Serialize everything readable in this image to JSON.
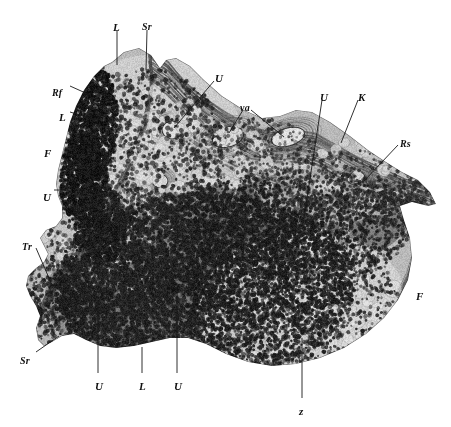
{
  "figure": {
    "type": "histological-micrograph-illustration",
    "background_color": "#ffffff",
    "ink_color": "#1a1a1a",
    "width_px": 451,
    "height_px": 427
  },
  "labels": [
    {
      "id": "L-top",
      "text": "L",
      "x": 113,
      "y": 22,
      "note": "top edge, left leader"
    },
    {
      "id": "Sr-top",
      "text": "Sr",
      "x": 142,
      "y": 22,
      "note": "top edge, right leader"
    },
    {
      "id": "Rf-left",
      "text": "Rf",
      "x": 52,
      "y": 88,
      "note": "upper-left, two-branch leader"
    },
    {
      "id": "L-left",
      "text": "L",
      "x": 59,
      "y": 112,
      "note": "upper-left below Rf"
    },
    {
      "id": "F-left",
      "text": "F",
      "x": 44,
      "y": 148,
      "note": "free standing, left field"
    },
    {
      "id": "U-leftmid",
      "text": "U",
      "x": 43,
      "y": 192,
      "note": "left mid, short leader"
    },
    {
      "id": "U-upper",
      "text": "U",
      "x": 215,
      "y": 73,
      "note": "upper middle, long leader to vessel"
    },
    {
      "id": "va",
      "text": "va",
      "x": 240,
      "y": 103,
      "note": "two-branch leader to vessel lumens"
    },
    {
      "id": "U-right",
      "text": "U",
      "x": 320,
      "y": 92,
      "note": "upper right, long leader"
    },
    {
      "id": "K-right",
      "text": "K",
      "x": 358,
      "y": 92,
      "note": "upper right capsule"
    },
    {
      "id": "Rs-right",
      "text": "Rs",
      "x": 400,
      "y": 139,
      "note": "right side"
    },
    {
      "id": "F-right",
      "text": "F",
      "x": 416,
      "y": 291,
      "note": "free standing, right field"
    },
    {
      "id": "Tr-left",
      "text": "Tr",
      "x": 22,
      "y": 242,
      "note": "lower left, leader into trabecula"
    },
    {
      "id": "Sr-bottom",
      "text": "Sr",
      "x": 20,
      "y": 356,
      "note": "lower left, leader up-right"
    },
    {
      "id": "U-bot1",
      "text": "U",
      "x": 95,
      "y": 381,
      "note": "bottom, first vertical leader"
    },
    {
      "id": "L-bot",
      "text": "L",
      "x": 139,
      "y": 381,
      "note": "bottom, middle vertical leader"
    },
    {
      "id": "U-bot2",
      "text": "U",
      "x": 174,
      "y": 381,
      "note": "bottom, third vertical leader"
    },
    {
      "id": "z-bot",
      "text": "z",
      "x": 299,
      "y": 406,
      "note": "bottom, leader into pale zone"
    }
  ],
  "leader_lines": [
    {
      "id": "leader-L-top",
      "points": "117,30 117,65"
    },
    {
      "id": "leader-Sr-top",
      "points": "147,30 146,70"
    },
    {
      "id": "leader-Rf-left",
      "points": "70,86 90,95 94,103"
    },
    {
      "id": "leader-L-left",
      "points": "70,112 96,120"
    },
    {
      "id": "leader-U-leftmid",
      "points": "54,190 68,190"
    },
    {
      "id": "leader-U-upper",
      "points": "214,81 174,128"
    },
    {
      "id": "leader-va-a",
      "points": "243,110 229,133"
    },
    {
      "id": "leader-va-b",
      "points": "251,110 284,137"
    },
    {
      "id": "leader-U-right",
      "points": "322,100 304,218"
    },
    {
      "id": "leader-K-right",
      "points": "358,100 341,143"
    },
    {
      "id": "leader-Rs-right",
      "points": "398,145 364,181"
    },
    {
      "id": "leader-Tr-left",
      "points": "36,248 52,285"
    },
    {
      "id": "leader-Sr-bottom",
      "points": "36,352 59,336"
    },
    {
      "id": "leader-U-bot1",
      "points": "98,373 98,302"
    },
    {
      "id": "leader-L-bot",
      "points": "142,373 142,347"
    },
    {
      "id": "leader-U-bot2",
      "points": "177,373 177,283"
    },
    {
      "id": "leader-z-bot",
      "points": "302,398 302,338"
    }
  ]
}
